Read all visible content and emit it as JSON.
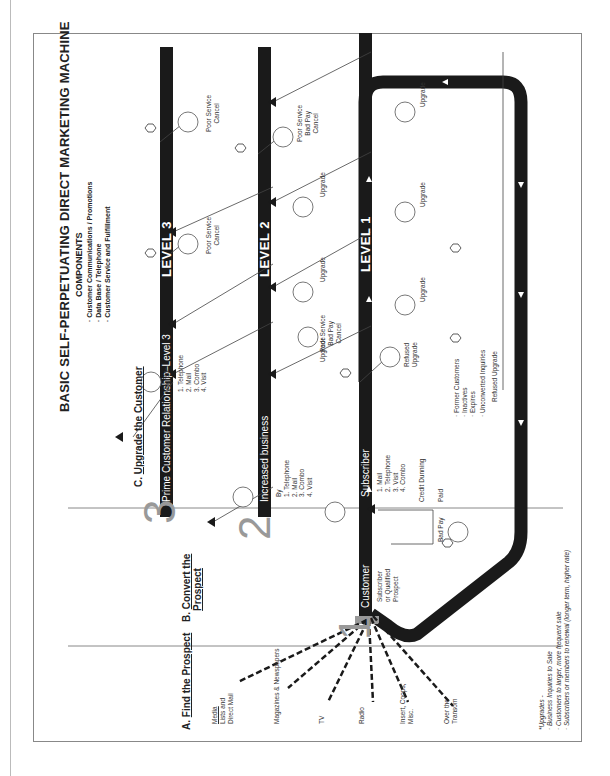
{
  "title": "BASIC SELF-PERPETUATING DIRECT MARKETING MACHINE",
  "components": {
    "heading": "COMPONENTS",
    "items": [
      "Customer Communications / Promotions",
      "Data Base / Telephone",
      "Customer Service and Fulfillment"
    ]
  },
  "sections": {
    "a": {
      "letter": "A.",
      "label": "Find the Prospect"
    },
    "b": {
      "letter": "B.",
      "label": "Convert the",
      "label2": "Prospect"
    },
    "c": {
      "letter": "C.",
      "label": "Upgrade the Customer"
    }
  },
  "big_numbers": {
    "n1": "1",
    "n2": "2",
    "n3": "3"
  },
  "levels": {
    "level1": "LEVEL 1",
    "level2": "LEVEL 2",
    "level3": "LEVEL 3"
  },
  "bars": {
    "prime": "Prime Customer Relationship–Level 3",
    "increased": "Increased business",
    "customer": "Customer",
    "subscriber": "Subscriber"
  },
  "lists": {
    "level3_by": [
      "1. Telephone",
      "2. Mail",
      "3. Combo",
      "4. Visit"
    ],
    "increased_by_heading": "By",
    "increased_by": [
      "1. Telephone",
      "2. Mail",
      "3. Combo",
      "4. Visit"
    ],
    "subscriber_by": [
      "1. Mail",
      "2. Telephone",
      "3. Visit",
      "4. Combo"
    ],
    "customer_note": [
      "Subscriber",
      "or Qualified",
      "Prospect"
    ]
  },
  "sources": [
    {
      "line1": "Media",
      "line2": "Lists and",
      "line3": "Direct Mail"
    },
    {
      "line1": "Magazines & Newspapers"
    },
    {
      "line1": "TV"
    },
    {
      "line1": "Radio"
    },
    {
      "line1": "Insert, Coops,",
      "line2": "Misc."
    },
    {
      "line1": "Over the",
      "line2": "Transom"
    }
  ],
  "labels": {
    "upgrade": "Upgrade",
    "poor_service_cancel": [
      "Poor Service",
      "Cancel"
    ],
    "poor_service_badpay_cancel": [
      "Poor Service",
      "Bad Pay",
      "Cancel"
    ],
    "refused_upgrade": [
      "Refused",
      "Upgrade"
    ],
    "refused_upgrade_inline": "Refused Upgrade",
    "credit_dunning": "Credit  Dunning",
    "bad_pay": "Bad Pay",
    "paid": "Paid",
    "former_customers": [
      "· Former Customers",
      "· Inactives",
      "· Expires"
    ],
    "unconverted": "· Unconverted Inquiries"
  },
  "footnote": {
    "heading": "*Upgrades -",
    "items": [
      "· Business Inquiries to Sale",
      "· Customers to larger, more frequent sale",
      "· Subscribers or members to renewal (longer term, higher rate)"
    ]
  },
  "colors": {
    "bar": "#1a1a1a",
    "number_gray": "#999999",
    "line": "#444444"
  }
}
